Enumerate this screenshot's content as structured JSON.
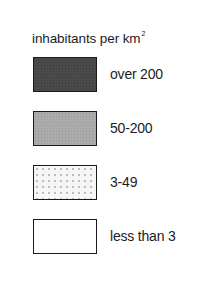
{
  "legend": {
    "title": "inhabitants per km",
    "title_superscript": "2",
    "items": [
      {
        "label": "over 200",
        "fill": "#4a4a4a",
        "pattern": "dense-dark"
      },
      {
        "label": "50-200",
        "fill": "#ababab",
        "pattern": "medium-grey"
      },
      {
        "label": "3-49",
        "fill": "#f6f6f6",
        "pattern": "light-dots"
      },
      {
        "label": "less than 3",
        "fill": "#ffffff",
        "pattern": "none"
      }
    ]
  }
}
